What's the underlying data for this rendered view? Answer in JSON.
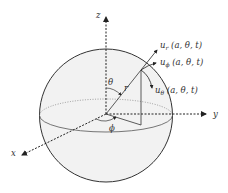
{
  "diagram": {
    "type": "spherical-coordinates",
    "axes": {
      "x": "x",
      "y": "y",
      "z": "z"
    },
    "angles": {
      "theta": "θ",
      "phi": "ϕ"
    },
    "radius_label": "r",
    "vectors": [
      {
        "name": "u",
        "sub": "r",
        "args": " (a, θ, t)"
      },
      {
        "name": "u",
        "sub": "ϕ",
        "args": " (a, θ, t)"
      },
      {
        "name": "u",
        "sub": "θ",
        "args": " (a, θ, t)"
      }
    ],
    "colors": {
      "sphere_fill": "#f2f2f2",
      "lines": "#333333"
    }
  }
}
